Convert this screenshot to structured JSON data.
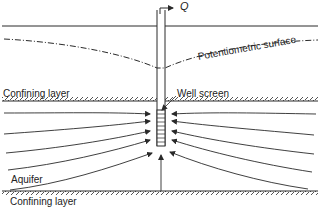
{
  "diagram": {
    "labels": {
      "discharge": "Q",
      "potentiometric_surface": "Potentiometric surface",
      "upper_confining_layer": "Confining layer",
      "well_screen": "Well screen",
      "aquifer": "Aquifer",
      "lower_confining_layer": "Confining layer"
    },
    "colors": {
      "line": "#2a2a2a",
      "background": "#ffffff"
    }
  }
}
